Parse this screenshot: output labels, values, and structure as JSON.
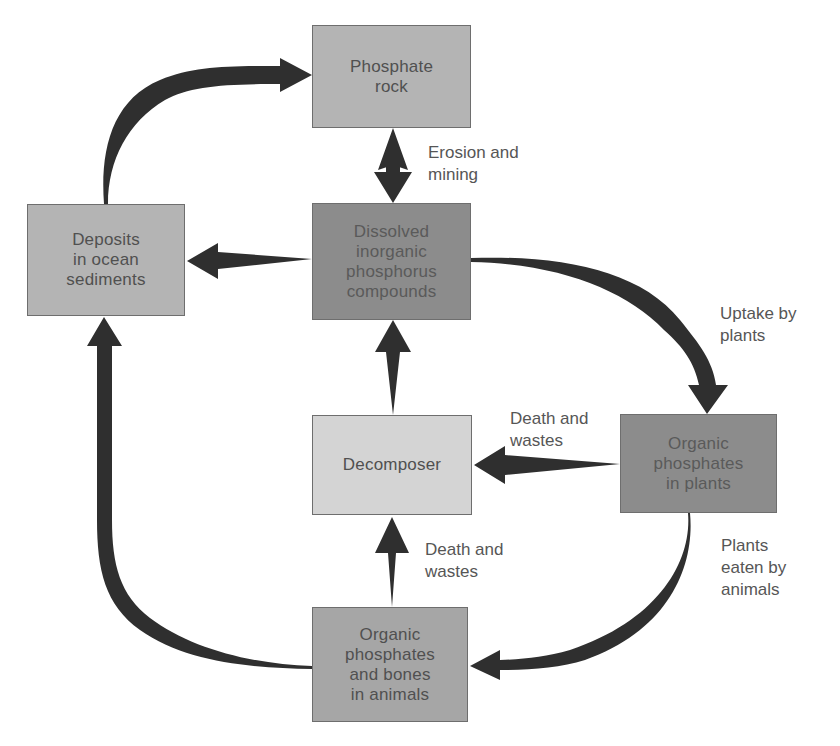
{
  "diagram": {
    "type": "cycle",
    "colors": {
      "arrow": "#2f2f2f",
      "light_box": "#b4b4b4",
      "lightest_box": "#d4d4d4",
      "dark_box": "#8c8c8c",
      "medium_box": "#a6a6a6",
      "text": "#505050"
    },
    "nodes": {
      "phosphate_rock": "Phosphate\nrock",
      "deposits": "Deposits\nin ocean\nsediments",
      "dissolved": "Dissolved\ninorganic\nphosphorus\ncompounds",
      "decomposer": "Decomposer",
      "plants": "Organic\nphosphates\nin plants",
      "animals": "Organic\nphosphates\nand bones\nin animals"
    },
    "edge_labels": {
      "erosion": "Erosion and\nmining",
      "uptake": "Uptake by\nplants",
      "death_plants": "Death and\nwastes",
      "death_animals": "Death and\nwastes",
      "eaten": "Plants\neaten by\nanimals"
    },
    "edges": [
      {
        "from": "Deposits in ocean sediments",
        "to": "Phosphate rock"
      },
      {
        "from": "Phosphate rock",
        "to": "Dissolved inorganic phosphorus compounds",
        "label": "Erosion and mining"
      },
      {
        "from": "Dissolved inorganic phosphorus compounds",
        "to": "Deposits in ocean sediments"
      },
      {
        "from": "Dissolved inorganic phosphorus compounds",
        "to": "Organic phosphates in plants",
        "label": "Uptake by plants"
      },
      {
        "from": "Organic phosphates in plants",
        "to": "Decomposer",
        "label": "Death and wastes"
      },
      {
        "from": "Decomposer",
        "to": "Dissolved inorganic phosphorus compounds"
      },
      {
        "from": "Organic phosphates in plants",
        "to": "Organic phosphates and bones in animals",
        "label": "Plants eaten by animals"
      },
      {
        "from": "Organic phosphates and bones in animals",
        "to": "Decomposer",
        "label": "Death and wastes"
      },
      {
        "from": "Organic phosphates and bones in animals",
        "to": "Deposits in ocean sediments"
      }
    ]
  }
}
